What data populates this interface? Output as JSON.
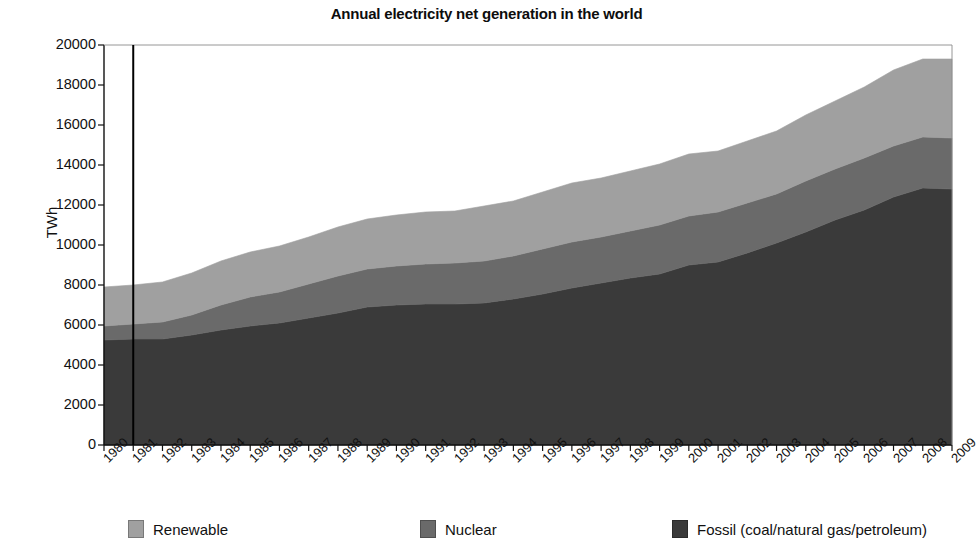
{
  "chart_data": {
    "type": "area",
    "stacked": true,
    "title": "Annual electricity net generation in the world",
    "xlabel": "",
    "ylabel": "TWh",
    "ylim": [
      0,
      20000
    ],
    "ytick_step": 2000,
    "yticks": [
      "20000",
      "18000",
      "16000",
      "14000",
      "12000",
      "10000",
      "8000",
      "6000",
      "4000",
      "2000",
      "0"
    ],
    "grid": false,
    "legend_position": "bottom",
    "categories": [
      "1980",
      "1981",
      "1982",
      "1983",
      "1984",
      "1985",
      "1986",
      "1987",
      "1988",
      "1989",
      "1990",
      "1991",
      "1992",
      "1993",
      "1994",
      "1995",
      "1996",
      "1997",
      "1998",
      "1999",
      "2000",
      "2001",
      "2002",
      "2003",
      "2004",
      "2005",
      "2006",
      "2007",
      "2008",
      "2009"
    ],
    "series": [
      {
        "name": "Fossil (coal/natural gas/petroleum)",
        "color": "#3a3a3a",
        "values": [
          5250,
          5300,
          5300,
          5500,
          5750,
          5950,
          6100,
          6350,
          6600,
          6900,
          7000,
          7050,
          7050,
          7100,
          7300,
          7550,
          7850,
          8100,
          8350,
          8550,
          9000,
          9150,
          9600,
          10100,
          10650,
          11250,
          11750,
          12400,
          12850,
          12800
        ]
      },
      {
        "name": "Nuclear",
        "color": "#6a6a6a",
        "values": [
          700,
          750,
          850,
          1000,
          1250,
          1450,
          1550,
          1700,
          1850,
          1900,
          1950,
          2000,
          2050,
          2100,
          2150,
          2250,
          2300,
          2300,
          2350,
          2450,
          2450,
          2500,
          2500,
          2450,
          2550,
          2550,
          2600,
          2550,
          2550,
          2550
        ]
      },
      {
        "name": "Renewable",
        "color": "#a0a0a0",
        "values": [
          1950,
          1950,
          2000,
          2100,
          2200,
          2250,
          2300,
          2350,
          2450,
          2500,
          2550,
          2600,
          2600,
          2750,
          2750,
          2850,
          2950,
          2950,
          3000,
          3050,
          3100,
          3050,
          3100,
          3150,
          3300,
          3400,
          3550,
          3800,
          3900,
          3950
        ]
      }
    ],
    "totals": [
      7900,
      8000,
      8150,
      8600,
      9200,
      9650,
      9950,
      10400,
      10900,
      11300,
      11500,
      11650,
      11700,
      11950,
      12200,
      12650,
      13100,
      13350,
      13700,
      14050,
      14550,
      14700,
      15200,
      15700,
      16500,
      17200,
      17900,
      18750,
      19300,
      19300
    ],
    "annotations": [
      {
        "name": "vertical-marker-line",
        "at_category": "1981",
        "color": "#000000"
      }
    ]
  },
  "legend": {
    "items": [
      {
        "label": "Renewable",
        "color": "#a0a0a0"
      },
      {
        "label": "Nuclear",
        "color": "#6a6a6a"
      },
      {
        "label": "Fossil (coal/natural gas/petroleum)",
        "color": "#3a3a3a"
      }
    ]
  }
}
